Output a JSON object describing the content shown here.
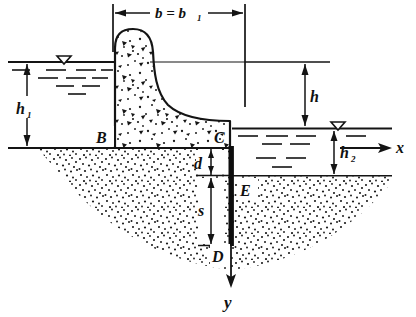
{
  "figure": {
    "type": "engineering-diagram",
    "background_color": "#ffffff",
    "ink_color": "#141414"
  },
  "labels": {
    "b_dimension": "b = b",
    "b_dimension_sub": "1",
    "h1": "h",
    "h1_sub": "1",
    "h": "h",
    "h2": "h",
    "h2_sub": "2",
    "d": "d",
    "s": "s",
    "point_b": "B",
    "point_c": "C",
    "point_d": "D",
    "point_e": "E",
    "axis_x": "x",
    "axis_y": "y"
  },
  "geometry": {
    "ground_line_y": 148,
    "upstream_water_y": 62,
    "downstream_water_y": 128,
    "downstream_bed_y": 175,
    "pile_tip_y": 245,
    "dam_left_x": 115,
    "dam_right_x": 230,
    "pile_x": 231,
    "b_left_x": 113,
    "b_right_x": 245,
    "x_axis_arrow_x": 392,
    "y_axis_arrow_y": 285
  },
  "colors": {
    "ink": "#141414",
    "soil_stipple": "#1a1a1a",
    "concrete_stipple": "#1a1a1a",
    "pile_fill": "#0d0d0d",
    "paper": "#ffffff"
  }
}
